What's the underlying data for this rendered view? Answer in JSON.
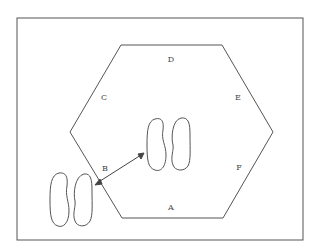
{
  "diagram": {
    "labels": {
      "A": "A",
      "B": "B",
      "C": "C",
      "D": "D",
      "E": "E",
      "F": "F"
    },
    "colors": {
      "stroke": "#555555",
      "background": "#ffffff"
    }
  }
}
